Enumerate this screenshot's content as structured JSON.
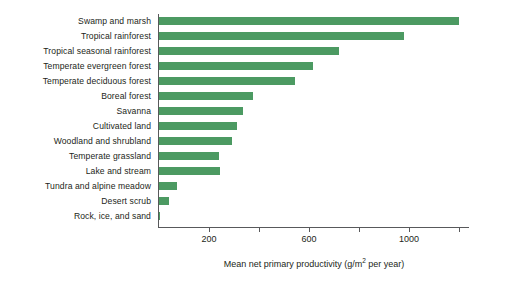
{
  "chart_data": {
    "type": "bar",
    "orientation": "horizontal",
    "title": "",
    "xlabel": "Mean net primary productivity (g/m2 per year)",
    "xlabel_parts": {
      "before": "Mean net primary productivity (g/m",
      "superscript": "2",
      "after": " per year)"
    },
    "ylabel": "",
    "categories": [
      "Swamp and marsh",
      "Tropical rainforest",
      "Tropical seasonal rainforest",
      "Temperate evergreen forest",
      "Temperate deciduous forest",
      "Boreal forest",
      "Savanna",
      "Cultivated land",
      "Woodland and shrubland",
      "Temperate grassland",
      "Lake and stream",
      "Tundra and alpine meadow",
      "Desert scrub",
      "Rock, ice, and sand"
    ],
    "values": [
      1200,
      980,
      720,
      615,
      545,
      375,
      335,
      310,
      290,
      240,
      245,
      70,
      40,
      3
    ],
    "xlim": [
      0,
      1240
    ],
    "xticks": [
      200,
      400,
      600,
      800,
      1000,
      1200
    ],
    "xtick_labels": [
      "200",
      "",
      "600",
      "",
      "1000",
      ""
    ],
    "grid": false,
    "legend": false,
    "bar_color": "#4c9a62",
    "axis_color": "#58595b",
    "text_color": "#231f20"
  }
}
